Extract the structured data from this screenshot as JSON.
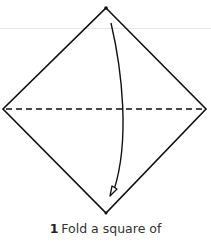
{
  "diagram": {
    "shape": "square rotated as diamond",
    "fold_line": "horizontal dashed (valley fold)",
    "arrow": "curved arrow from top corner to bottom corner",
    "colors": {
      "line": "#111111",
      "rule": "#e6e6e6",
      "text": "#333333"
    }
  },
  "caption": {
    "step_number": "1",
    "text": "Fold a square of"
  }
}
